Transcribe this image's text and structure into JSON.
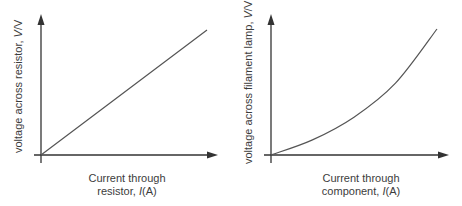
{
  "chart_data": [
    {
      "type": "line",
      "title": "",
      "xlabel": "Current through resistor, I(A)",
      "ylabel": "voltage across resistor, V/V",
      "xlabel_lines": [
        "Current through",
        "resistor, "
      ],
      "xlabel_unit_symbol": "I",
      "xlabel_unit": "(A)",
      "ylabel_prefix": "voltage across resistor, ",
      "ylabel_symbol": "V",
      "ylabel_unit": "/V",
      "grid": false,
      "ticks": false,
      "relationship": "linear, straight line through origin",
      "x": [
        0,
        0.25,
        0.5,
        0.75,
        1.0
      ],
      "y": [
        0,
        0.25,
        0.5,
        0.75,
        1.0
      ],
      "color": "#555555"
    },
    {
      "type": "line",
      "title": "",
      "xlabel": "Current through component, I(A)",
      "ylabel": "voltage across filament lamp, V/V",
      "xlabel_lines": [
        "Current through",
        "component, "
      ],
      "xlabel_unit_symbol": "I",
      "xlabel_unit": "(A)",
      "ylabel_prefix": "voltage across filament lamp, ",
      "ylabel_symbol": "V",
      "ylabel_unit": "/V",
      "grid": false,
      "ticks": false,
      "relationship": "non-linear, curving upward (gradient increases with current)",
      "x": [
        0,
        0.25,
        0.5,
        0.75,
        1.0
      ],
      "y": [
        0,
        0.12,
        0.3,
        0.57,
        1.0
      ],
      "color": "#555555"
    }
  ]
}
